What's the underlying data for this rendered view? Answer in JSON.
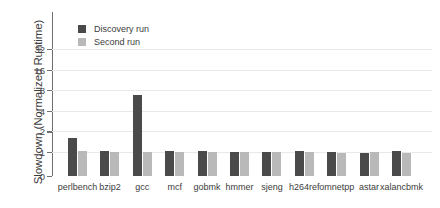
{
  "chart_data": {
    "type": "bar",
    "title": "",
    "xlabel": "",
    "ylabel": "Slowdown (Normalized Runtime)",
    "ylim": [
      0,
      40
    ],
    "ytick_labels": [
      "0",
      "1",
      "2",
      "4",
      "8",
      "16",
      "32"
    ],
    "ytick_values": [
      0,
      1,
      2,
      4,
      8,
      16,
      32
    ],
    "yscale": "symlog",
    "grid": true,
    "legend_position": "upper-left-inside",
    "categories": [
      "perlbench",
      "bzip2",
      "gcc",
      "mcf",
      "gobmk",
      "hmmer",
      "sjeng",
      "h264ref",
      "omnetpp",
      "astar",
      "xalancbmk"
    ],
    "series": [
      {
        "name": "Discovery run",
        "color": "#4a4a4a",
        "values": [
          1.6,
          1.05,
          6.7,
          1.05,
          1.05,
          1.0,
          1.0,
          1.05,
          1.0,
          0.97,
          1.05
        ]
      },
      {
        "name": "Second run",
        "color": "#b9b9b9",
        "values": [
          1.05,
          1.0,
          1.0,
          1.0,
          1.0,
          1.0,
          1.0,
          1.0,
          0.97,
          1.0,
          0.97
        ]
      }
    ]
  },
  "legend": {
    "items": [
      {
        "label": "Discovery run",
        "color": "#4a4a4a"
      },
      {
        "label": "Second run",
        "color": "#b9b9b9"
      }
    ]
  }
}
